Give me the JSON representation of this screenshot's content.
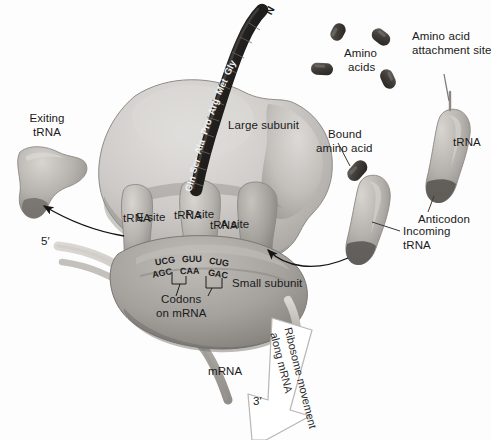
{
  "figure": {
    "style": "grayscale textbook illustration"
  },
  "colors": {
    "large_subunit": "#c9c6c3",
    "small_subunit": "#a9a6a3",
    "trna": "#b3b0ac",
    "amino_acid": "#4a4744",
    "chain": "#2b2927",
    "mrna": "#bfbcb8",
    "outline": "#7d7a77",
    "text": "#1a1a1a",
    "arrow": "#1a1a1a",
    "movement_arrow_fill": "#ffffff",
    "movement_arrow_stroke": "#b8b5b2"
  },
  "labels": {
    "exiting_trna": "Exiting\ntRNA",
    "exiting_trna_line1": "Exiting",
    "exiting_trna_line2": "tRNA",
    "large_subunit": "Large subunit",
    "small_subunit": "Small subunit",
    "e_site_prefix": "E",
    "e_site_suffix": " site",
    "e_site_line2": "tRNA",
    "p_site_prefix": "P",
    "p_site_suffix": " site",
    "p_site_line2": "tRNA",
    "a_site_prefix": "A",
    "a_site_suffix": " site",
    "a_site_line2": "tRNA",
    "codons_line1": "Codons",
    "codons_line2": "on mRNA",
    "mrna": "mRNA",
    "five_prime": "5′",
    "three_prime": "3′",
    "amino_acids_line1": "Amino",
    "amino_acids_line2": "acids",
    "attachment_line1": "Amino acid",
    "attachment_line2": "attachment site",
    "trna_right": "tRNA",
    "anticodon": "Anticodon",
    "bound_aa_line1": "Bound",
    "bound_aa_line2": "amino acid",
    "incoming_line1": "Incoming",
    "incoming_line2": "tRNA",
    "movement_line1": "Ribosome movement",
    "movement_line2": "along mRNA",
    "n_terminus": "N"
  },
  "polypeptide": {
    "terminus": "N",
    "residues": [
      "Gln",
      "Ser",
      "Ala",
      "Pro",
      "Arg",
      "Met",
      "Gly",
      "Glu",
      "Lys",
      "Val"
    ],
    "visible_residues": [
      "Gln",
      "Ser",
      "Ala",
      "Pro",
      "Arg",
      "Met",
      "Gly"
    ]
  },
  "nucleotides": {
    "anticodons": [
      "UCG",
      "GUU",
      "CUG"
    ],
    "codons": [
      "AGC",
      "CAA",
      "GAC"
    ],
    "anticodon_label": "anticodons on tRNA",
    "codon_label": "codons on mRNA"
  },
  "sites": [
    {
      "id": "E",
      "label": "E site",
      "sublabel": "tRNA"
    },
    {
      "id": "P",
      "label": "P site",
      "sublabel": "tRNA"
    },
    {
      "id": "A",
      "label": "A site",
      "sublabel": "tRNA"
    }
  ]
}
